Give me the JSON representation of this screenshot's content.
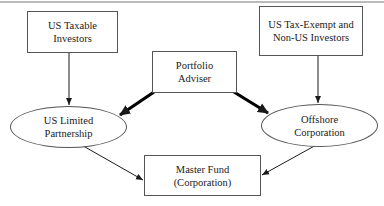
{
  "diagram": {
    "nodes": {
      "us_taxable": {
        "shape": "box",
        "lines": [
          "US Taxable",
          "Investors"
        ]
      },
      "us_tax_exempt": {
        "shape": "box",
        "lines": [
          "US Tax-Exempt and",
          "Non-US Investors"
        ]
      },
      "portfolio_adviser": {
        "shape": "box",
        "lines": [
          "Portfolio",
          "Adviser"
        ]
      },
      "us_lp": {
        "shape": "ellipse",
        "lines": [
          "US Limited",
          "Partnership"
        ]
      },
      "offshore_corp": {
        "shape": "ellipse",
        "lines": [
          "Offshore",
          "Corporation"
        ]
      },
      "master_fund": {
        "shape": "box",
        "lines": [
          "Master Fund",
          "(Corporation)"
        ]
      }
    },
    "edges": [
      {
        "from": "US Taxable Investors",
        "to": "US Limited Partnership",
        "style": "thin"
      },
      {
        "from": "US Tax-Exempt and Non-US Investors",
        "to": "Offshore Corporation",
        "style": "thin"
      },
      {
        "from": "Portfolio Adviser",
        "to": "US Limited Partnership",
        "style": "thick"
      },
      {
        "from": "Portfolio Adviser",
        "to": "Offshore Corporation",
        "style": "thick"
      },
      {
        "from": "US Limited Partnership",
        "to": "Master Fund (Corporation)",
        "style": "thin"
      },
      {
        "from": "Offshore Corporation",
        "to": "Master Fund (Corporation)",
        "style": "thin"
      }
    ],
    "colors": {
      "stroke": "#1a1a1a",
      "border": "#555555",
      "background": "#ffffff"
    }
  }
}
